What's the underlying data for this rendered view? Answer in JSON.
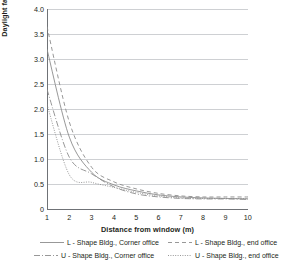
{
  "chart_data": {
    "type": "line",
    "title": "",
    "xlabel": "Distance from window (m)",
    "ylabel": "Daylight factor (%)",
    "xlim": [
      1,
      10
    ],
    "ylim": [
      0,
      4.0
    ],
    "grid": true,
    "legend_position": "bottom",
    "x": [
      1,
      2,
      3,
      4,
      5,
      6,
      7,
      8,
      9,
      10
    ],
    "xticks": [
      "1",
      "2",
      "3",
      "4",
      "5",
      "6",
      "7",
      "8",
      "9",
      "10"
    ],
    "yticks": [
      "0",
      "0.5",
      "1.0",
      "1.5",
      "2.0",
      "2.5",
      "3.0",
      "3.5",
      "4.0"
    ],
    "series": [
      {
        "name": "L - Shape Bldg., Corner office",
        "style": "solid",
        "color": "#8c8c8c",
        "values": [
          3.2,
          1.45,
          0.75,
          0.5,
          0.38,
          0.3,
          0.26,
          0.24,
          0.23,
          0.22
        ]
      },
      {
        "name": "L - Shape Bldg., end office",
        "style": "dashed",
        "color": "#8c8c8c",
        "values": [
          3.65,
          1.75,
          0.85,
          0.56,
          0.42,
          0.33,
          0.28,
          0.26,
          0.26,
          0.26
        ]
      },
      {
        "name": "U - Shape Bldg., Corner office",
        "style": "dashdot",
        "color": "#8c8c8c",
        "values": [
          2.4,
          1.05,
          0.72,
          0.46,
          0.32,
          0.26,
          0.23,
          0.22,
          0.22,
          0.21
        ]
      },
      {
        "name": "U - Shape Bldg., end office",
        "style": "dotted",
        "color": "#8c8c8c",
        "values": [
          2.1,
          0.7,
          0.55,
          0.45,
          0.35,
          0.28,
          0.24,
          0.23,
          0.23,
          0.23
        ]
      }
    ]
  },
  "axes": {
    "ylabel": "Daylight factor (%)",
    "xlabel": "Distance from window (m)",
    "yticks": [
      {
        "label": "4.0"
      },
      {
        "label": "3.5"
      },
      {
        "label": "3.0"
      },
      {
        "label": "2.5"
      },
      {
        "label": "2.0"
      },
      {
        "label": "1.5"
      },
      {
        "label": "1.0"
      },
      {
        "label": "0.5"
      },
      {
        "label": "0"
      }
    ],
    "xticks": [
      {
        "label": "1"
      },
      {
        "label": "2"
      },
      {
        "label": "3"
      },
      {
        "label": "4"
      },
      {
        "label": "5"
      },
      {
        "label": "6"
      },
      {
        "label": "7"
      },
      {
        "label": "8"
      },
      {
        "label": "9"
      },
      {
        "label": "10"
      }
    ]
  },
  "legend": {
    "items": [
      {
        "label": "L - Shape Bldg., Corner office"
      },
      {
        "label": "L - Shape Bldg., end office"
      },
      {
        "label": "U - Shape Bldg., Corner office"
      },
      {
        "label": "U - Shape Bldg., end office"
      }
    ]
  },
  "colors": {
    "line": "#8c8c8c",
    "grid": "#b9bcc0",
    "axis": "#6f7276",
    "text": "#231f20"
  }
}
